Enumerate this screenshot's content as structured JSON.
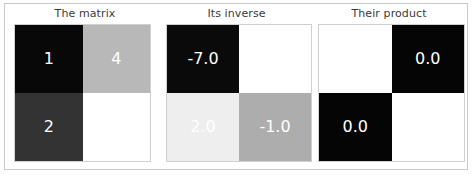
{
  "figure": {
    "background_color": "#ffffff",
    "frame_color": "#c9c9c9",
    "annotation_text_color": "#ffffff",
    "title_color": "#3a3a3a"
  },
  "panels": [
    {
      "title": "The matrix",
      "cells": [
        {
          "label": "1",
          "color": "#080808"
        },
        {
          "label": "4",
          "color": "#b8b8b8"
        },
        {
          "label": "2",
          "color": "#333333"
        },
        {
          "label": "7",
          "color": "#ffffff"
        }
      ]
    },
    {
      "title": "Its inverse",
      "cells": [
        {
          "label": "-7.0",
          "color": "#0a0a0a"
        },
        {
          "label": "4.0",
          "color": "#ffffff"
        },
        {
          "label": "2.0",
          "color": "#eeeeee"
        },
        {
          "label": "-1.0",
          "color": "#adadad"
        }
      ]
    },
    {
      "title": "Their product",
      "cells": [
        {
          "label": "1.0",
          "color": "#ffffff"
        },
        {
          "label": "0.0",
          "color": "#050505"
        },
        {
          "label": "0.0",
          "color": "#050505"
        },
        {
          "label": "1.0",
          "color": "#ffffff"
        }
      ]
    }
  ],
  "chart_data": {
    "type": "heatmap",
    "title": "",
    "subplots": [
      {
        "title": "The matrix",
        "matrix": [
          [
            1,
            4
          ],
          [
            2,
            7
          ]
        ],
        "annotations": [
          [
            "1",
            "4"
          ],
          [
            "2",
            "7"
          ]
        ],
        "cmap": "gray",
        "vmin": 1,
        "vmax": 7,
        "xticks": [],
        "yticks": [],
        "grid": false
      },
      {
        "title": "Its inverse",
        "matrix": [
          [
            -7.0,
            4.0
          ],
          [
            2.0,
            -1.0
          ]
        ],
        "annotations": [
          [
            "-7.0",
            "4.0"
          ],
          [
            "2.0",
            "-1.0"
          ]
        ],
        "cmap": "gray",
        "vmin": -7.0,
        "vmax": 4.0,
        "xticks": [],
        "yticks": [],
        "grid": false
      },
      {
        "title": "Their product",
        "matrix": [
          [
            1.0,
            0.0
          ],
          [
            0.0,
            1.0
          ]
        ],
        "annotations": [
          [
            "1.0",
            "0.0"
          ],
          [
            "0.0",
            "1.0"
          ]
        ],
        "cmap": "gray",
        "vmin": 0.0,
        "vmax": 1.0,
        "xticks": [],
        "yticks": [],
        "grid": false
      }
    ],
    "legend": null,
    "xlabel": "",
    "ylabel": ""
  }
}
